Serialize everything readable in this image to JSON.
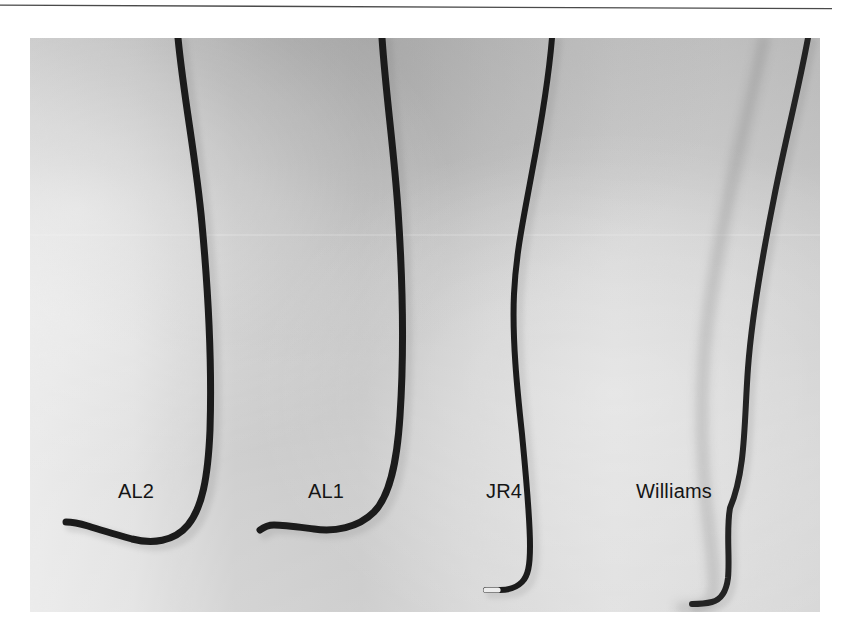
{
  "figure": {
    "kind": "photograph",
    "background_color": "#cfcfcf",
    "page_color": "#ffffff",
    "catheter_color": "#1a1a1a",
    "rule_color": "#4a4a4a"
  },
  "rule": {
    "name": "horizontal-rule",
    "left": 0,
    "top": 4,
    "width": 832
  },
  "photo": {
    "left": 30,
    "top": 38,
    "width": 790,
    "height": 574
  },
  "labels": [
    {
      "id": "al2",
      "text": "AL2",
      "x": 118,
      "y": 481
    },
    {
      "id": "al1",
      "text": "AL1",
      "x": 308,
      "y": 481
    },
    {
      "id": "jr4",
      "text": "JR4",
      "x": 486,
      "y": 481
    },
    {
      "id": "williams",
      "text": "Williams",
      "x": 636,
      "y": 481
    }
  ],
  "catheters": [
    {
      "id": "al2",
      "label": "AL2",
      "tip_marker": "none",
      "stroke_width": 7,
      "path": "M 148 0 C 154 62 166 120 172 186 C 179 262 182 330 180 392 C 178 440 172 470 158 487 C 144 504 122 506 102 501 C 84 496 70 492 58 488 C 48 485 42 484 36 484",
      "tip": {
        "x": 36,
        "y": 484
      }
    },
    {
      "id": "al1",
      "label": "AL1",
      "tip_marker": "none",
      "stroke_width": 7,
      "path": "M 352 0 C 356 58 364 112 368 172 C 373 246 374 318 370 378 C 367 424 360 458 344 474 C 328 490 304 494 284 491 C 268 489 254 487 244 487 C 238 487 234 489 230 492",
      "tip": {
        "x": 230,
        "y": 492
      }
    },
    {
      "id": "jr4",
      "label": "JR4",
      "tip_marker": "white",
      "stroke_width": 6,
      "path": "M 522 0 C 518 48 510 92 502 134 C 494 178 486 214 484 256 C 482 300 487 350 492 396 C 496 438 500 478 500 508 C 500 528 498 538 492 544 C 486 550 478 552 470 552 C 464 552 460 552 456 552",
      "tip": {
        "x": 456,
        "y": 552
      }
    },
    {
      "id": "williams-shadow",
      "label": "Williams (shadow)",
      "tip_marker": "white",
      "stroke_width": 9,
      "opacity": 0.3,
      "path": "M 734 0 C 724 52 710 104 700 154 C 688 212 678 266 674 318 C 670 372 672 420 676 462 C 680 500 684 528 684 546 C 684 560 680 566 672 568 C 664 570 656 570 650 570",
      "tip": {
        "x": 650,
        "y": 570
      }
    },
    {
      "id": "williams",
      "label": "Williams",
      "tip_marker": "none",
      "stroke_width": 6,
      "path": "M 778 0 C 768 54 754 108 744 160 C 732 220 722 276 718 330 C 714 384 716 432 700 470 C 696 492 700 520 698 540 C 696 556 690 562 682 564 C 674 566 668 566 662 566",
      "tip": {
        "x": 662,
        "y": 566
      }
    }
  ]
}
